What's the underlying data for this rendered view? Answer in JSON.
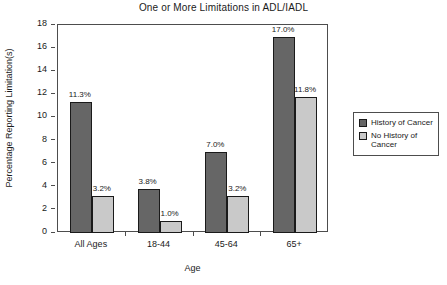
{
  "chart_data": {
    "type": "bar",
    "title": "One or More Limitations in ADL/IADL",
    "xlabel": "Age",
    "ylabel": "Percentage Reporting Limitation(s)",
    "categories": [
      "All Ages",
      "18-44",
      "45-64",
      "65+"
    ],
    "series": [
      {
        "name": "History of Cancer",
        "color": "#666666",
        "values": [
          11.3,
          3.8,
          7.0,
          17.0
        ],
        "labels": [
          "11.3%",
          "3.8%",
          "7.0%",
          "17.0%"
        ]
      },
      {
        "name": "No History of Cancer",
        "color": "#c9c9c9",
        "values": [
          3.2,
          1.0,
          3.2,
          11.8
        ],
        "labels": [
          "3.2%",
          "1.0%",
          "3.2%",
          "11.8%"
        ]
      }
    ],
    "ylim": [
      0,
      18
    ],
    "yticks": [
      0,
      2,
      4,
      6,
      8,
      10,
      12,
      14,
      16,
      18
    ],
    "ytick_labels": [
      "0",
      "2",
      "4",
      "6",
      "8",
      "10",
      "12",
      "14",
      "16",
      "18"
    ],
    "grid": false,
    "legend_position": "right"
  },
  "legend": {
    "entries": [
      {
        "label": "History of Cancer"
      },
      {
        "label": "No History of Cancer"
      }
    ]
  }
}
